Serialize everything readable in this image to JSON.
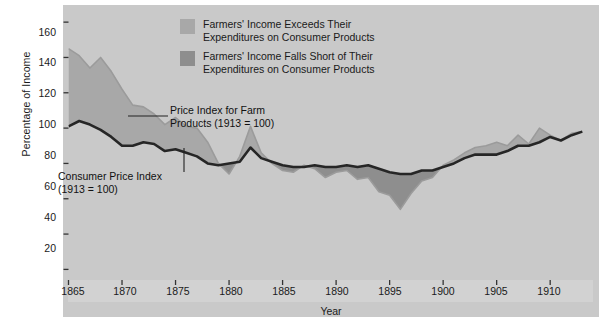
{
  "chart_data": {
    "type": "line",
    "title": "",
    "xlabel": "Year",
    "ylabel": "Percentage of Income",
    "xlim": [
      1865,
      1914
    ],
    "ylim": [
      14,
      168
    ],
    "grid": false,
    "legend_position": "top-center",
    "xticks": [
      1865,
      1870,
      1875,
      1880,
      1885,
      1890,
      1895,
      1900,
      1905,
      1910
    ],
    "yticks": [
      20,
      40,
      60,
      80,
      100,
      120,
      140,
      160
    ],
    "x": [
      1865,
      1866,
      1867,
      1868,
      1869,
      1870,
      1871,
      1872,
      1873,
      1874,
      1875,
      1876,
      1877,
      1878,
      1879,
      1880,
      1881,
      1882,
      1883,
      1884,
      1885,
      1886,
      1887,
      1888,
      1889,
      1890,
      1891,
      1892,
      1893,
      1894,
      1895,
      1896,
      1897,
      1898,
      1899,
      1900,
      1901,
      1902,
      1903,
      1904,
      1905,
      1906,
      1907,
      1908,
      1909,
      1910,
      1911,
      1912,
      1913
    ],
    "series": [
      {
        "name": "Price Index for Farm Products (1913 = 100)",
        "color": "#9b9b9b",
        "values": [
          145,
          141,
          134,
          140,
          132,
          122,
          113,
          112,
          108,
          102,
          106,
          101,
          100,
          92,
          80,
          74,
          84,
          101,
          86,
          80,
          76,
          75,
          79,
          77,
          72,
          75,
          76,
          71,
          72,
          64,
          62,
          54,
          63,
          70,
          72,
          79,
          82,
          86,
          89,
          90,
          92,
          90,
          96,
          91,
          100,
          96,
          93,
          97,
          98
        ]
      },
      {
        "name": "Consumer Price Index (1913 = 100)",
        "color": "#262626",
        "values": [
          101,
          104,
          102,
          99,
          95,
          90,
          90,
          92,
          91,
          87,
          88,
          86,
          84,
          80,
          79,
          80,
          81,
          89,
          83,
          81,
          79,
          78,
          78,
          79,
          78,
          78,
          79,
          78,
          79,
          77,
          75,
          74,
          74,
          76,
          76,
          78,
          80,
          83,
          85,
          85,
          85,
          87,
          90,
          90,
          92,
          95,
          93,
          96,
          98
        ]
      }
    ],
    "fills": [
      {
        "name": "Farmers' Income Exceeds Their Expenditures on Consumer Products",
        "color": "#a8a8a8",
        "meaning": "area where farm price index is above consumer price index"
      },
      {
        "name": "Farmers' Income Falls Short of Their Expenditures on Consumer Products",
        "color": "#8e8e8e",
        "meaning": "area where farm price index is below consumer price index"
      }
    ]
  },
  "axes": {
    "ylabel": "Percentage of Income",
    "xlabel": "Year",
    "yticks": [
      "160",
      "140",
      "120",
      "100",
      "80",
      "60",
      "40",
      "20"
    ],
    "xticks": [
      "1865",
      "1870",
      "1875",
      "1880",
      "1885",
      "1890",
      "1895",
      "1900",
      "1905",
      "1910"
    ]
  },
  "legend": {
    "items": [
      {
        "swatch_color": "#a8a8a8",
        "label": "Farmers' Income Exceeds Their\nExpenditures on Consumer Products"
      },
      {
        "swatch_color": "#8e8e8e",
        "label": "Farmers' Income Falls Short of Their\nExpenditures on Consumer Products"
      }
    ]
  },
  "annotations": {
    "farm_label": "Price Index for Farm\nProducts (1913 = 100)",
    "cpi_label": "Consumer Price Index\n(1913 = 100)"
  },
  "colors": {
    "panel_background": "#f3f3f1",
    "frame": "#c9c9c9",
    "axis_strip": "#d2d2d2",
    "line_cpi": "#262626",
    "line_farm": "#9b9b9b",
    "fill_above": "#a8a8a8",
    "fill_below": "#8e8e8e"
  }
}
